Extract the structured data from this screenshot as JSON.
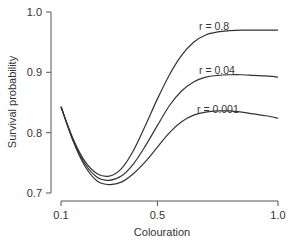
{
  "chart_data": {
    "type": "line",
    "title": "",
    "xlabel": "Colouration",
    "ylabel": "Survival probability",
    "xlim": [
      0.1,
      1.0
    ],
    "ylim": [
      0.7,
      1.0
    ],
    "x_ticks": [
      "0.1",
      "0.5",
      "1.0"
    ],
    "y_ticks": [
      "0.7",
      "0.8",
      "0.9",
      "1.0"
    ],
    "grid": false,
    "legend": "inline labels near curves",
    "x": [
      0.1,
      0.15,
      0.2,
      0.25,
      0.3,
      0.35,
      0.4,
      0.45,
      0.5,
      0.55,
      0.6,
      0.65,
      0.7,
      0.75,
      0.8,
      0.85,
      0.9,
      0.95,
      1.0
    ],
    "series": [
      {
        "name": "r = 0.8",
        "values": [
          0.843,
          0.79,
          0.752,
          0.732,
          0.728,
          0.74,
          0.77,
          0.812,
          0.856,
          0.896,
          0.928,
          0.95,
          0.962,
          0.967,
          0.969,
          0.97,
          0.97,
          0.97,
          0.97
        ]
      },
      {
        "name": "r = 0.04",
        "values": [
          0.843,
          0.788,
          0.748,
          0.726,
          0.721,
          0.728,
          0.748,
          0.778,
          0.812,
          0.845,
          0.869,
          0.884,
          0.892,
          0.895,
          0.896,
          0.896,
          0.895,
          0.894,
          0.892
        ]
      },
      {
        "name": "r = 0.001",
        "values": [
          0.843,
          0.786,
          0.744,
          0.72,
          0.714,
          0.718,
          0.732,
          0.752,
          0.776,
          0.8,
          0.818,
          0.829,
          0.834,
          0.836,
          0.836,
          0.834,
          0.831,
          0.828,
          0.824
        ]
      }
    ]
  },
  "labels": {
    "series_0": "r = 0.8",
    "series_1": "r = 0.04",
    "series_2": "r = 0.001",
    "xlabel": "Colouration",
    "ylabel": "Survival probability",
    "x_tick_0": "0.1",
    "x_tick_1": "0.5",
    "x_tick_2": "1.0",
    "y_tick_0": "0.7",
    "y_tick_1": "0.8",
    "y_tick_2": "0.9",
    "y_tick_3": "1.0"
  }
}
